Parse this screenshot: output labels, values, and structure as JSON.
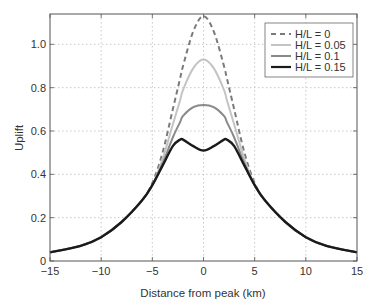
{
  "chart_data": {
    "type": "line",
    "title": "",
    "xlabel": "Distance from peak (km)",
    "ylabel": "Uplift",
    "xlim": [
      -15,
      15
    ],
    "ylim": [
      0,
      1.14
    ],
    "grid": true,
    "legend_position": "upper right",
    "xticks": [
      -15,
      -10,
      -5,
      0,
      5,
      10,
      15
    ],
    "xtick_labels": [
      "−15",
      "−10",
      "−5",
      "0",
      "5",
      "10",
      "15"
    ],
    "yticks": [
      0,
      0.2,
      0.4,
      0.6,
      0.8,
      1.0
    ],
    "ytick_labels": [
      "0",
      "0.2",
      "0.4",
      "0.6",
      "0.8",
      "1.0"
    ],
    "x": [
      -15,
      -12,
      -10,
      -8,
      -6,
      -5,
      -4,
      -3,
      -2.3,
      -2,
      -1,
      0,
      1,
      2,
      2.3,
      3,
      4,
      5,
      6,
      8,
      10,
      12,
      15
    ],
    "series": [
      {
        "name": "H/L = 0",
        "style": "dashed",
        "color": "#7a7a7a",
        "values": [
          0.04,
          0.07,
          0.11,
          0.18,
          0.28,
          0.36,
          0.5,
          0.7,
          0.84,
          0.9,
          1.06,
          1.13,
          1.06,
          0.9,
          0.84,
          0.7,
          0.5,
          0.36,
          0.28,
          0.18,
          0.11,
          0.07,
          0.04
        ]
      },
      {
        "name": "H/L = 0.05",
        "style": "solid",
        "color": "#c4c4c4",
        "values": [
          0.04,
          0.07,
          0.11,
          0.18,
          0.28,
          0.35,
          0.47,
          0.63,
          0.74,
          0.79,
          0.89,
          0.93,
          0.89,
          0.79,
          0.74,
          0.63,
          0.47,
          0.35,
          0.28,
          0.18,
          0.11,
          0.07,
          0.04
        ]
      },
      {
        "name": "H/L = 0.1",
        "style": "solid",
        "color": "#8a8a8a",
        "values": [
          0.04,
          0.07,
          0.11,
          0.18,
          0.28,
          0.35,
          0.45,
          0.57,
          0.64,
          0.67,
          0.71,
          0.72,
          0.71,
          0.67,
          0.64,
          0.57,
          0.45,
          0.35,
          0.28,
          0.18,
          0.11,
          0.07,
          0.04
        ]
      },
      {
        "name": "H/L = 0.15",
        "style": "solid",
        "color": "#1a1a1a",
        "values": [
          0.04,
          0.07,
          0.11,
          0.18,
          0.28,
          0.35,
          0.44,
          0.53,
          0.56,
          0.56,
          0.53,
          0.51,
          0.53,
          0.56,
          0.56,
          0.53,
          0.44,
          0.35,
          0.28,
          0.18,
          0.11,
          0.07,
          0.04
        ]
      }
    ]
  }
}
